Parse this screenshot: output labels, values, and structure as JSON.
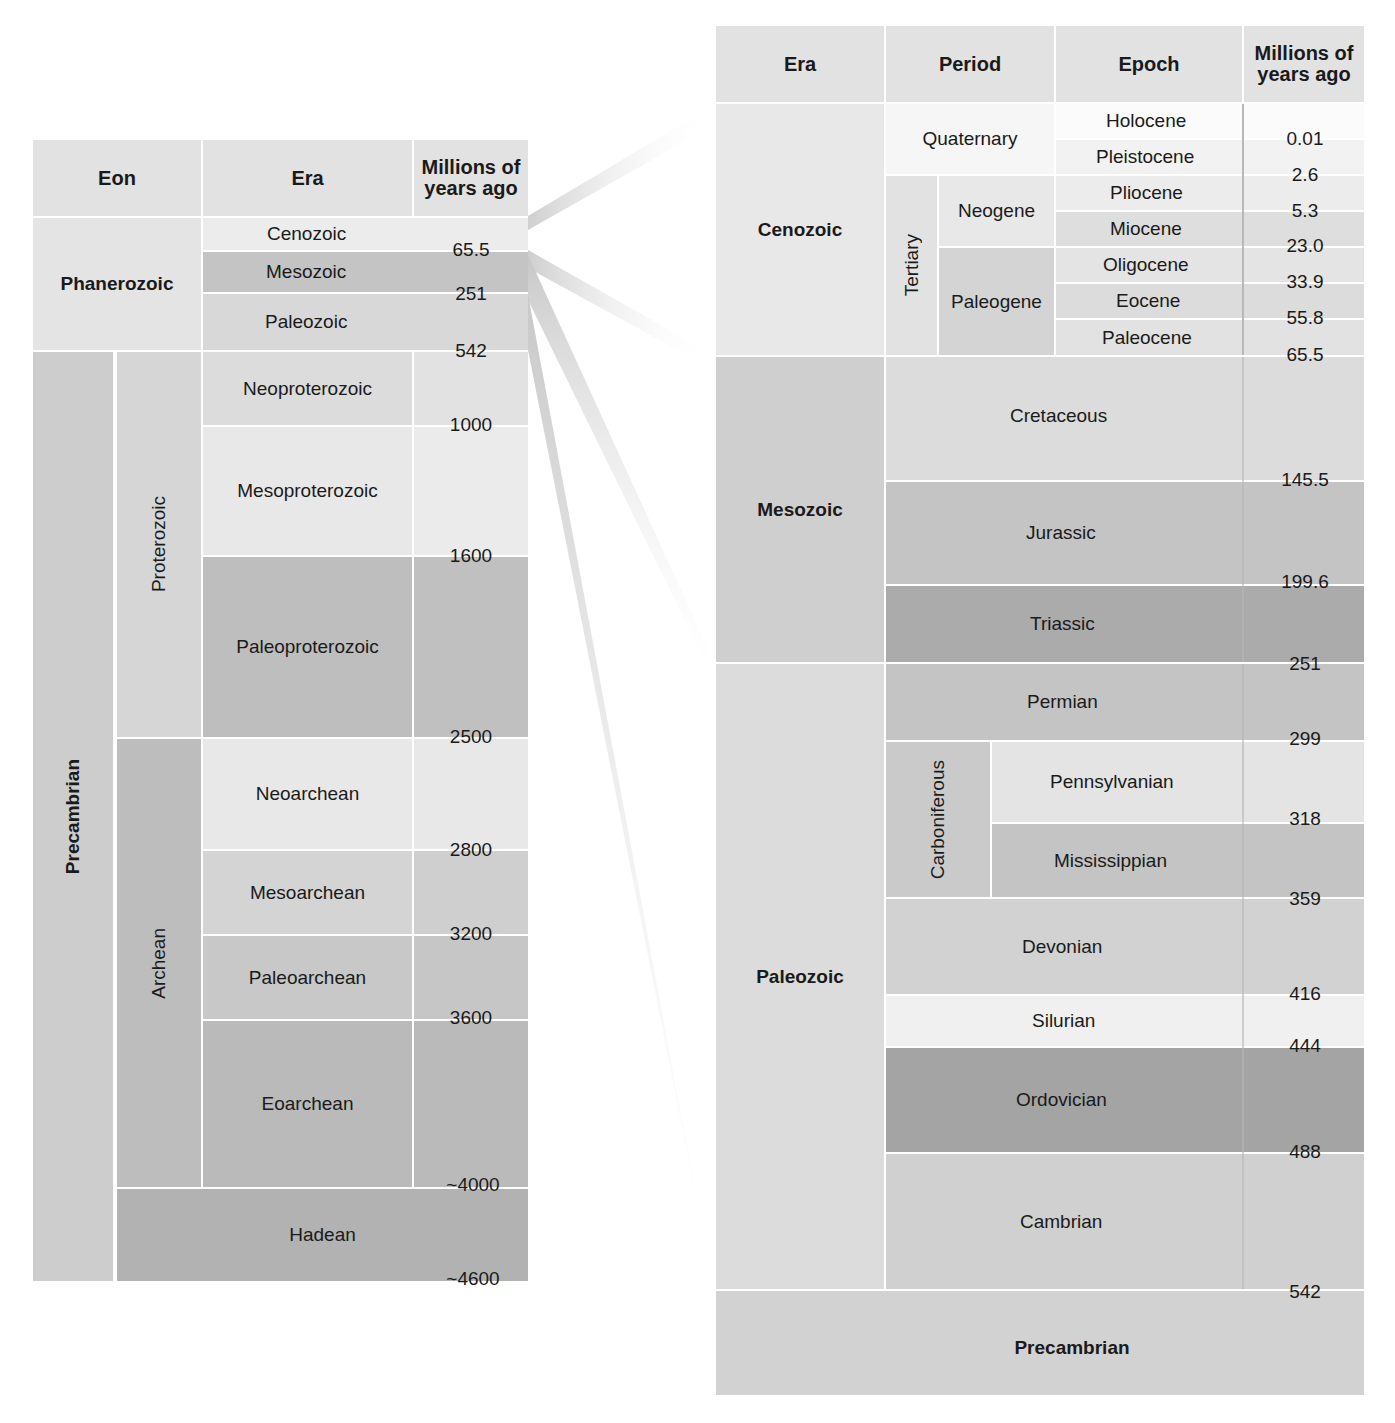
{
  "left_table": {
    "headers": {
      "eon": "Eon",
      "era": "Era",
      "mya": "Millions of years ago"
    },
    "eons": [
      {
        "name": "Phanerozoic",
        "bold": true
      },
      {
        "name": "Precambrian",
        "bold": true
      }
    ],
    "sub_eons": [
      {
        "name": "Proterozoic"
      },
      {
        "name": "Archean"
      }
    ],
    "eras": [
      {
        "name": "Cenozoic",
        "color": "#e6e6e6"
      },
      {
        "name": "Mesozoic",
        "color": "#c2c2c2"
      },
      {
        "name": "Paleozoic",
        "color": "#d6d6d6"
      },
      {
        "name": "Neoproterozoic",
        "color": "#dcdcdc"
      },
      {
        "name": "Mesoproterozoic",
        "color": "#e8e8e8"
      },
      {
        "name": "Paleoproterozoic",
        "color": "#bcbcbc"
      },
      {
        "name": "Neoarchean",
        "color": "#e8e8e8"
      },
      {
        "name": "Mesoarchean",
        "color": "#d4d4d4"
      },
      {
        "name": "Paleoarchean",
        "color": "#c6c6c6"
      },
      {
        "name": "Eoarchean",
        "color": "#b8b8b8"
      },
      {
        "name": "Hadean",
        "color": "#b0b0b0"
      }
    ],
    "boundaries": [
      "65.5",
      "251",
      "542",
      "1000",
      "1600",
      "2500",
      "2800",
      "3200",
      "3600",
      "~4000",
      "~4600"
    ]
  },
  "right_table": {
    "headers": {
      "era": "Era",
      "period": "Period",
      "epoch": "Epoch",
      "mya": "Millions of years ago"
    },
    "eras": [
      {
        "name": "Cenozoic"
      },
      {
        "name": "Mesozoic"
      },
      {
        "name": "Paleozoic"
      },
      {
        "name": "Precambrian"
      }
    ],
    "cenozoic": {
      "quaternary": "Quaternary",
      "tertiary": "Tertiary",
      "neogene": "Neogene",
      "paleogene": "Paleogene",
      "epochs": [
        "Holocene",
        "Pleistocene",
        "Pliocene",
        "Miocene",
        "Oligocene",
        "Eocene",
        "Paleocene"
      ],
      "boundaries": [
        "0.01",
        "2.6",
        "5.3",
        "23.0",
        "33.9",
        "55.8",
        "65.5"
      ]
    },
    "mesozoic": {
      "periods": [
        "Cretaceous",
        "Jurassic",
        "Triassic"
      ],
      "boundaries": [
        "145.5",
        "199.6",
        "251"
      ]
    },
    "paleozoic": {
      "carboniferous": "Carboniferous",
      "periods": [
        "Permian",
        "Pennsylvanian",
        "Mississippian",
        "Devonian",
        "Silurian",
        "Ordovician",
        "Cambrian"
      ],
      "boundaries": [
        "299",
        "318",
        "359",
        "416",
        "444",
        "488",
        "542"
      ]
    }
  }
}
